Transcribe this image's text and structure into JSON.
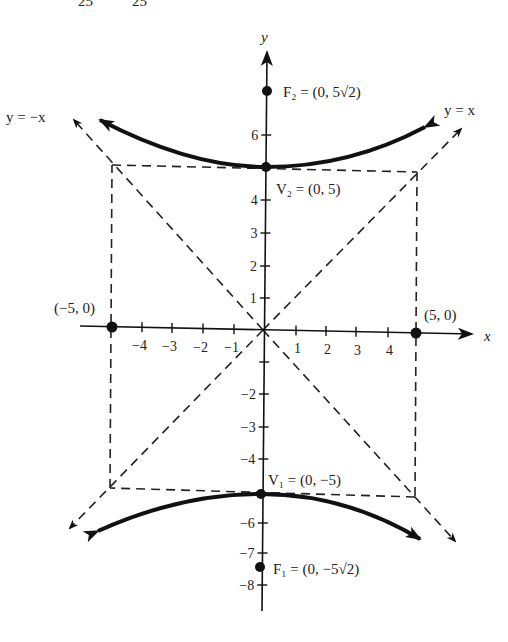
{
  "header_fragment": {
    "left": "25",
    "right": "25"
  },
  "axes": {
    "x_label": "x",
    "y_label": "y"
  },
  "x_ticks": [
    {
      "v": "−4",
      "px": 142
    },
    {
      "v": "−3",
      "px": 172
    },
    {
      "v": "−2",
      "px": 203
    },
    {
      "v": "−1",
      "px": 234
    },
    {
      "v": "1",
      "px": 296
    },
    {
      "v": "2",
      "px": 326
    },
    {
      "v": "3",
      "px": 356
    },
    {
      "v": "4",
      "px": 388
    }
  ],
  "y_ticks": [
    {
      "v": "6",
      "py": 135
    },
    {
      "v": "4",
      "py": 200
    },
    {
      "v": "3",
      "py": 233
    },
    {
      "v": "2",
      "py": 266
    },
    {
      "v": "1",
      "py": 298
    },
    {
      "v": "",
      "py": 362
    },
    {
      "v": "−2",
      "py": 394
    },
    {
      "v": "−3",
      "py": 427
    },
    {
      "v": "−4",
      "py": 459
    },
    {
      "v": "−6",
      "py": 523
    },
    {
      "v": "−7",
      "py": 553
    },
    {
      "v": "−8",
      "py": 585
    }
  ],
  "labels": {
    "asymptote_neg": "y = −x",
    "asymptote_pos": "y = x",
    "focus_top": "F₂ = (0, 5√2)",
    "vertex_top": "V₂ = (0, 5)",
    "vertex_bottom": "V₁ = (0, −5)",
    "focus_bottom": "F₁ = (0, −5√2)",
    "point_left": "(−5, 0)",
    "point_right": "(5, 0)"
  },
  "chart_data": {
    "type": "diagram",
    "curve": "hyperbola",
    "vertices": [
      [
        0,
        5
      ],
      [
        0,
        -5
      ]
    ],
    "foci": [
      [
        0,
        7.071
      ],
      [
        0,
        -7.071
      ]
    ],
    "co_vertices": [
      [
        -5,
        0
      ],
      [
        5,
        0
      ]
    ],
    "asymptotes": [
      "y = x",
      "y = -x"
    ],
    "fundamental_rectangle": [
      [
        -5,
        5
      ],
      [
        5,
        5
      ],
      [
        5,
        -5
      ],
      [
        -5,
        -5
      ]
    ],
    "xlim": [
      -5.5,
      6.5
    ],
    "ylim": [
      -8.5,
      8
    ],
    "x_ticks": [
      -4,
      -3,
      -2,
      -1,
      1,
      2,
      3,
      4
    ],
    "y_ticks": [
      -8,
      -7,
      -6,
      -4,
      -3,
      -2,
      -1,
      1,
      2,
      3,
      4,
      6
    ]
  }
}
